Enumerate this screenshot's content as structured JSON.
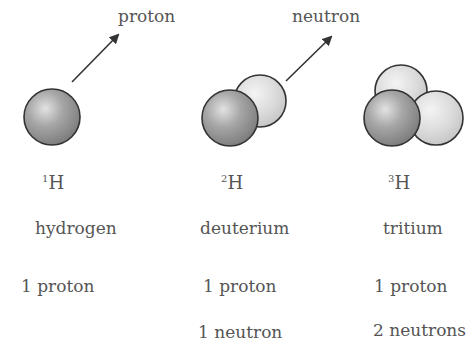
{
  "labels": {
    "proton_arrow": "proton",
    "neutron_arrow": "neutron"
  },
  "isotopes": [
    {
      "mass_number": "1",
      "element": "H",
      "name": "hydrogen",
      "protons": "1 proton",
      "neutrons": ""
    },
    {
      "mass_number": "2",
      "element": "H",
      "name": "deuterium",
      "protons": "1 proton",
      "neutrons": "1 neutron"
    },
    {
      "mass_number": "3",
      "element": "H",
      "name": "tritium",
      "protons": "1 proton",
      "neutrons": "2 neutrons"
    }
  ],
  "colors": {
    "proton": "#8f8f8f",
    "neutron": "#d6d6d6",
    "outline": "#333333",
    "text": "#555555"
  }
}
